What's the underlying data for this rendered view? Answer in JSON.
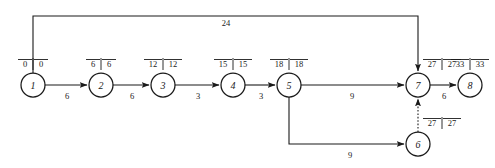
{
  "diagram": {
    "type": "network-graph",
    "width": 495,
    "height": 168,
    "stroke_color": "#1a1a1a",
    "background_color": "#ffffff"
  },
  "nodes": [
    {
      "id": "1",
      "label": "1",
      "cx": 33,
      "cy": 85,
      "r": 12,
      "earliest": "0",
      "latest": "0",
      "time_label_x": 33,
      "time_label_y": 64
    },
    {
      "id": "2",
      "label": "2",
      "cx": 101,
      "cy": 85,
      "r": 12,
      "earliest": "6",
      "latest": "6",
      "time_label_x": 101,
      "time_label_y": 64
    },
    {
      "id": "3",
      "label": "3",
      "cx": 163,
      "cy": 85,
      "r": 12,
      "earliest": "12",
      "latest": "12",
      "time_label_x": 163,
      "time_label_y": 64
    },
    {
      "id": "4",
      "label": "4",
      "cx": 233,
      "cy": 85,
      "r": 12,
      "earliest": "15",
      "latest": "15",
      "time_label_x": 233,
      "time_label_y": 64
    },
    {
      "id": "5",
      "label": "5",
      "cx": 289,
      "cy": 85,
      "r": 12,
      "earliest": "18",
      "latest": "18",
      "time_label_x": 289,
      "time_label_y": 64
    },
    {
      "id": "6",
      "label": "6",
      "cx": 418,
      "cy": 144,
      "r": 12,
      "earliest": "27",
      "latest": "27",
      "time_label_x": 432,
      "time_label_y": 123
    },
    {
      "id": "7",
      "label": "7",
      "cx": 418,
      "cy": 85,
      "r": 12,
      "earliest": "27",
      "latest": "27",
      "time_label_x": 432,
      "time_label_y": 64
    },
    {
      "id": "8",
      "label": "8",
      "cx": 470,
      "cy": 85,
      "r": 12,
      "earliest": "33",
      "latest": "33",
      "time_label_x": 470,
      "time_label_y": 64
    }
  ],
  "edges": [
    {
      "id": "e1-2",
      "from": "1",
      "to": "2",
      "weight": "6",
      "label_x": 67,
      "label_y": 97,
      "style": "solid",
      "shape": "straight"
    },
    {
      "id": "e2-3",
      "from": "2",
      "to": "3",
      "weight": "6",
      "label_x": 132,
      "label_y": 97,
      "style": "solid",
      "shape": "straight"
    },
    {
      "id": "e3-4",
      "from": "3",
      "to": "4",
      "weight": "3",
      "label_x": 198,
      "label_y": 97,
      "style": "solid",
      "shape": "straight"
    },
    {
      "id": "e4-5",
      "from": "4",
      "to": "5",
      "weight": "3",
      "label_x": 261,
      "label_y": 97,
      "style": "solid",
      "shape": "straight"
    },
    {
      "id": "e5-7",
      "from": "5",
      "to": "7",
      "weight": "9",
      "label_x": 352,
      "label_y": 97,
      "style": "solid",
      "shape": "straight"
    },
    {
      "id": "e7-8",
      "from": "7",
      "to": "8",
      "weight": "6",
      "label_x": 444,
      "label_y": 97,
      "style": "solid",
      "shape": "straight"
    },
    {
      "id": "e1-7",
      "from": "1",
      "to": "7",
      "weight": "24",
      "label_x": 226,
      "label_y": 24,
      "style": "solid",
      "shape": "top-bracket"
    },
    {
      "id": "e5-6",
      "from": "5",
      "to": "6",
      "weight": "9",
      "label_x": 350,
      "label_y": 156,
      "style": "solid",
      "shape": "bottom-bracket"
    },
    {
      "id": "e6-7",
      "from": "6",
      "to": "7",
      "weight": "",
      "label_x": 0,
      "label_y": 0,
      "style": "dotted",
      "shape": "vertical"
    }
  ]
}
